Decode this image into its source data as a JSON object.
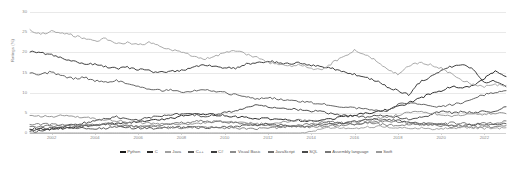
{
  "chart_data": {
    "type": "line",
    "title": "",
    "xlabel": "",
    "ylabel": "Ratings (%)",
    "ylim": [
      0,
      30
    ],
    "xlim": [
      2001,
      2023
    ],
    "grid": true,
    "legend_position": "bottom",
    "yticks": [
      "30",
      "25",
      "20",
      "15",
      "10",
      "5",
      "0"
    ],
    "ytick_values": [
      30,
      25,
      20,
      15,
      10,
      5,
      0
    ],
    "xticks": [
      "2002",
      "2004",
      "2006",
      "2008",
      "2010",
      "2012",
      "2014",
      "2016",
      "2018",
      "2020",
      "2022"
    ],
    "xtick_values": [
      2002,
      2004,
      2006,
      2008,
      2010,
      2012,
      2014,
      2016,
      2018,
      2020,
      2022
    ],
    "x": [
      2001,
      2001.5,
      2002,
      2002.5,
      2003,
      2003.5,
      2004,
      2004.5,
      2005,
      2005.5,
      2006,
      2006.5,
      2007,
      2007.5,
      2008,
      2008.5,
      2009,
      2009.5,
      2010,
      2010.5,
      2011,
      2011.5,
      2012,
      2012.5,
      2013,
      2013.5,
      2014,
      2014.5,
      2015,
      2015.5,
      2016,
      2016.5,
      2017,
      2017.5,
      2018,
      2018.5,
      2019,
      2019.5,
      2020,
      2020.5,
      2021,
      2021.5,
      2022,
      2022.5,
      2023
    ],
    "series": [
      {
        "name": "Python",
        "color": "#1a1a1a",
        "values": [
          0.8,
          0.9,
          1.0,
          1.1,
          1.3,
          1.6,
          2.0,
          2.2,
          2.4,
          2.6,
          2.8,
          3.0,
          3.3,
          3.6,
          4.2,
          4.5,
          4.8,
          4.5,
          4.3,
          4.0,
          3.8,
          3.6,
          3.5,
          3.3,
          3.2,
          3.1,
          3.0,
          3.2,
          3.6,
          4.0,
          4.4,
          4.8,
          5.2,
          5.8,
          6.5,
          7.5,
          8.5,
          9.8,
          10.5,
          11.5,
          11.0,
          12.0,
          13.5,
          15.5,
          14.0
        ]
      },
      {
        "name": "C",
        "color": "#2b2b2b",
        "values": [
          20.2,
          19.8,
          19.5,
          18.6,
          17.8,
          17.2,
          17.0,
          16.4,
          16.0,
          16.3,
          15.8,
          15.4,
          15.0,
          15.3,
          15.5,
          16.2,
          17.0,
          16.6,
          16.2,
          16.0,
          17.0,
          17.3,
          17.8,
          17.5,
          17.0,
          17.4,
          16.8,
          16.4,
          16.0,
          15.2,
          14.5,
          13.8,
          13.0,
          11.5,
          10.5,
          9.5,
          12.5,
          14.0,
          15.5,
          16.5,
          17.0,
          15.8,
          12.5,
          13.0,
          11.5
        ]
      },
      {
        "name": "Java",
        "color": "#a0a0a0",
        "values": [
          25.5,
          24.5,
          25.2,
          24.8,
          24.2,
          23.5,
          22.8,
          23.5,
          22.0,
          22.5,
          21.8,
          22.4,
          21.5,
          20.8,
          20.0,
          19.2,
          18.2,
          19.0,
          19.8,
          20.5,
          19.5,
          18.8,
          17.5,
          17.0,
          16.5,
          17.0,
          16.0,
          15.5,
          17.5,
          19.0,
          20.5,
          19.5,
          18.0,
          16.0,
          14.5,
          16.5,
          17.5,
          17.0,
          16.0,
          14.5,
          13.0,
          12.0,
          11.5,
          12.0,
          11.8
        ]
      },
      {
        "name": "C++",
        "color": "#555555",
        "values": [
          15.0,
          14.5,
          15.2,
          14.0,
          13.5,
          13.8,
          13.0,
          12.5,
          13.0,
          12.2,
          11.5,
          11.0,
          10.5,
          10.8,
          10.2,
          10.5,
          10.8,
          10.4,
          10.0,
          9.5,
          9.0,
          8.5,
          8.8,
          8.4,
          8.0,
          7.8,
          7.5,
          7.2,
          6.8,
          6.5,
          6.2,
          6.0,
          5.8,
          5.5,
          7.0,
          7.5,
          7.0,
          6.8,
          6.5,
          7.0,
          7.5,
          8.5,
          9.5,
          10.0,
          10.5
        ]
      },
      {
        "name": "C#",
        "color": "#3d3d3d",
        "values": [
          0.3,
          0.5,
          1.0,
          1.5,
          2.0,
          2.5,
          3.0,
          3.5,
          4.0,
          3.5,
          3.2,
          3.8,
          4.2,
          4.5,
          4.8,
          4.5,
          4.2,
          4.5,
          5.0,
          5.5,
          6.5,
          6.8,
          6.5,
          6.2,
          6.0,
          5.8,
          5.5,
          5.2,
          4.8,
          4.5,
          4.2,
          4.0,
          4.5,
          4.2,
          3.8,
          3.5,
          3.8,
          4.5,
          5.5,
          5.0,
          5.2,
          5.0,
          5.5,
          5.2,
          6.5
        ]
      },
      {
        "name": "Visual Basic",
        "color": "#8c8c8c",
        "values": [
          4.5,
          4.2,
          4.0,
          4.3,
          4.0,
          3.8,
          3.5,
          3.2,
          3.0,
          2.8,
          2.6,
          2.5,
          2.3,
          2.2,
          2.0,
          2.2,
          2.5,
          2.8,
          3.0,
          2.8,
          2.5,
          2.3,
          2.2,
          2.5,
          2.8,
          3.2,
          3.0,
          2.8,
          2.5,
          2.3,
          2.8,
          3.0,
          3.5,
          4.0,
          4.5,
          5.0,
          5.5,
          5.0,
          4.5,
          4.0,
          4.5,
          5.0,
          4.5,
          5.0,
          4.8
        ]
      },
      {
        "name": "JavaScript",
        "color": "#6e6e6e",
        "values": [
          1.5,
          1.6,
          1.8,
          1.7,
          1.6,
          1.8,
          2.0,
          2.2,
          2.0,
          1.8,
          1.6,
          1.8,
          2.0,
          2.2,
          2.5,
          2.8,
          3.0,
          2.8,
          2.6,
          2.4,
          2.2,
          2.0,
          1.8,
          1.6,
          1.8,
          2.0,
          2.2,
          2.5,
          2.8,
          2.5,
          2.3,
          2.5,
          2.8,
          3.0,
          2.8,
          2.5,
          2.2,
          2.0,
          2.2,
          2.5,
          2.3,
          2.2,
          2.5,
          2.3,
          3.0
        ]
      },
      {
        "name": "SQL",
        "color": "#4a4a4a",
        "values": [
          1.0,
          1.1,
          1.2,
          1.3,
          1.2,
          1.1,
          1.0,
          1.2,
          1.4,
          1.3,
          1.2,
          1.1,
          1.2,
          1.3,
          1.5,
          1.4,
          1.3,
          1.4,
          1.5,
          1.6,
          1.8,
          2.0,
          2.2,
          2.0,
          1.8,
          1.6,
          1.8,
          2.0,
          2.2,
          2.5,
          2.8,
          3.2,
          3.5,
          3.2,
          3.0,
          2.8,
          2.5,
          2.3,
          2.2,
          2.0,
          1.8,
          2.0,
          2.2,
          2.0,
          2.3
        ]
      },
      {
        "name": "Assembly language",
        "color": "#777777",
        "values": [
          2.0,
          2.1,
          2.2,
          2.0,
          1.8,
          1.9,
          2.0,
          2.2,
          2.0,
          1.8,
          1.6,
          1.5,
          1.4,
          1.3,
          1.2,
          1.3,
          1.5,
          1.4,
          1.3,
          1.2,
          1.1,
          1.0,
          1.2,
          1.4,
          1.6,
          1.5,
          1.4,
          1.6,
          1.8,
          2.0,
          2.2,
          2.5,
          2.3,
          2.0,
          1.8,
          2.0,
          2.2,
          2.0,
          1.8,
          1.6,
          1.5,
          1.4,
          1.6,
          1.5,
          1.8
        ]
      },
      {
        "name": "Swift",
        "color": "#9a9a9a",
        "values": [
          0.0,
          0.0,
          0.0,
          0.0,
          0.0,
          0.0,
          0.0,
          0.0,
          0.0,
          0.0,
          0.0,
          0.0,
          0.0,
          0.0,
          0.0,
          0.0,
          0.0,
          0.0,
          0.0,
          0.0,
          0.0,
          0.0,
          0.0,
          0.0,
          0.0,
          0.0,
          0.5,
          1.0,
          1.5,
          1.3,
          1.2,
          1.4,
          1.6,
          1.5,
          1.4,
          1.3,
          1.2,
          1.1,
          1.0,
          1.2,
          1.4,
          1.3,
          1.2,
          1.1,
          1.3
        ]
      }
    ]
  },
  "axis": {
    "y_title": "Ratings (%)"
  }
}
